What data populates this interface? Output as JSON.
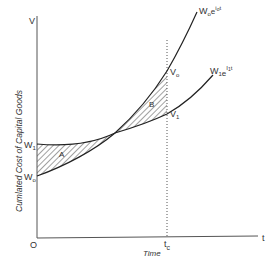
{
  "diagram": {
    "type": "economic-cost-curves",
    "axes": {
      "y_label": "V",
      "x_label": "t",
      "origin_label": "O",
      "y_title": "Cumlated Cost of Capital Goods",
      "x_title": "Time"
    },
    "y_ticks": {
      "w1": "W",
      "w1_sub": "1",
      "w0": "W",
      "w0_sub": "o"
    },
    "marker": {
      "label": "t",
      "label_sub": "c"
    },
    "curves": [
      {
        "name": "W",
        "sub1": "o",
        "e": "e",
        "exp": "i",
        "exp_sub": "o",
        "exp_tail": "t"
      },
      {
        "name": "W",
        "sub1": "1",
        "e": "e",
        "exp": "I",
        "exp_sub": "1",
        "exp_tail": "t"
      }
    ],
    "points": {
      "v0": "V",
      "v0_sub": "o",
      "v1": "V",
      "v1_sub": "1"
    },
    "regions": {
      "a": "A",
      "b": "B"
    }
  }
}
